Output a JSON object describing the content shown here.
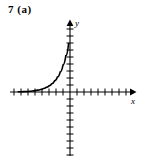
{
  "figure": {
    "problem_label": "7 (a)",
    "part": "(a)",
    "number": "7"
  },
  "axes": {
    "x_label": "x",
    "y_label": "y",
    "origin": {
      "x": 70,
      "y": 92
    },
    "tick_spacing": 7,
    "x_ticks_left": 8,
    "x_ticks_right": 8,
    "y_ticks_up": 8,
    "y_ticks_down": 9,
    "x_range_px": [
      10,
      132
    ],
    "y_range_px": [
      22,
      156
    ],
    "arrow_x": "right",
    "arrow_y": "up",
    "axis_color": "#000000",
    "grid": false
  },
  "chart_data": {
    "type": "line",
    "title": "",
    "subtitle": "",
    "xlabel": "x",
    "ylabel": "y",
    "curve_name": "exponential growth",
    "grid": false,
    "legend": "none",
    "xlim": [
      -8.6,
      8.9
    ],
    "ylim": [
      -9.1,
      10.0
    ],
    "x": [
      -7.4,
      -7.0,
      -6.6,
      -6.2,
      -5.8,
      -5.4,
      -5.0,
      -4.6,
      -4.2,
      -3.8,
      -3.4,
      -3.0,
      -2.6,
      -2.2,
      -1.8,
      -1.4,
      -1.0,
      -0.6,
      -0.2
    ],
    "values": [
      0.03,
      0.04,
      0.06,
      0.08,
      0.11,
      0.15,
      0.2,
      0.27,
      0.36,
      0.49,
      0.66,
      0.88,
      1.18,
      1.59,
      2.13,
      2.86,
      3.84,
      5.16,
      6.92
    ],
    "series": [
      {
        "name": "exponential growth",
        "x": [
          -7.4,
          -7.0,
          -6.6,
          -6.2,
          -5.8,
          -5.4,
          -5.0,
          -4.6,
          -4.2,
          -3.8,
          -3.4,
          -3.0,
          -2.6,
          -2.2,
          -1.8,
          -1.4,
          -1.0,
          -0.6,
          -0.2
        ],
        "values": [
          0.03,
          0.04,
          0.06,
          0.08,
          0.11,
          0.15,
          0.2,
          0.27,
          0.36,
          0.49,
          0.66,
          0.88,
          1.18,
          1.59,
          2.13,
          2.86,
          3.84,
          5.16,
          6.92
        ]
      }
    ],
    "annotations": [],
    "curve_color": "#000000",
    "curve_path": "M 16,90.8 C 24,90.2 32,89.2 40,85.0 C 45,82.0 49,72.0 51.5,58.0 C 53.0,48.0 53.6,40.0 53.8,33.0"
  }
}
